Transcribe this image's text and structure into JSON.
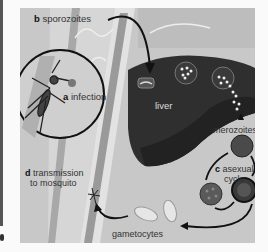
{
  "figure": {
    "labels": {
      "sporozoites": {
        "letter": "b",
        "text": "sporozoites"
      },
      "infection": {
        "letter": "a",
        "text": "infection"
      },
      "liver": {
        "text": "liver"
      },
      "merozoites": {
        "text": "merozoites"
      },
      "asexual_cycle": {
        "letter": "c",
        "text_line1": "asexual",
        "text_line2": "cycle"
      },
      "transmission": {
        "letter": "d",
        "text_line1": "transmission",
        "text_line2": "to mosquito"
      },
      "gametocytes": {
        "text": "gametocytes"
      }
    },
    "colors": {
      "panel_background": "#c8c8c8",
      "liver": "#2e2e2e",
      "blood_vessel": "#d8d8d8",
      "vessel_edge": "#9a9a9a",
      "arrows": "#1a1a1a",
      "red_cell": "#4a4a4a"
    }
  }
}
